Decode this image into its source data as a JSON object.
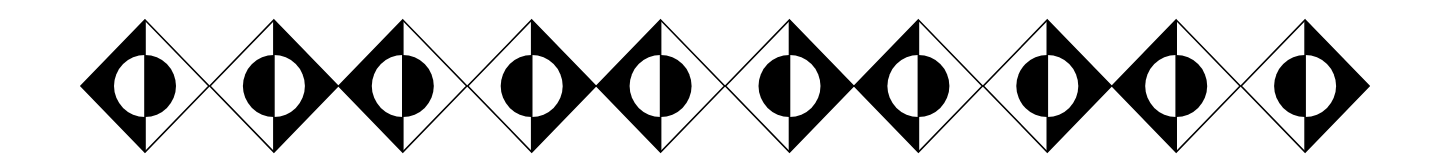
{
  "colors": {
    "background": "#ffffff",
    "ink": "#000000"
  },
  "geometry": {
    "first_center_x": 145,
    "spacing": 128.9,
    "center_y": 86,
    "half_width": 64,
    "half_height": 66,
    "circle_radius": 31,
    "stroke_width": 1.6
  },
  "diamonds": [
    {
      "index": 1,
      "variant": "A"
    },
    {
      "index": 2,
      "variant": "B"
    },
    {
      "index": 3,
      "variant": "A"
    },
    {
      "index": 4,
      "variant": "B"
    },
    {
      "index": 5,
      "variant": "A"
    },
    {
      "index": 6,
      "variant": "B"
    },
    {
      "index": 7,
      "variant": "A"
    },
    {
      "index": 8,
      "variant": "B"
    },
    {
      "index": 9,
      "variant": "A"
    },
    {
      "index": 10,
      "variant": "B"
    }
  ],
  "variants": {
    "A": {
      "filled_triangle": "left",
      "filled_semicircle": "right"
    },
    "B": {
      "filled_triangle": "right",
      "filled_semicircle": "left"
    }
  }
}
